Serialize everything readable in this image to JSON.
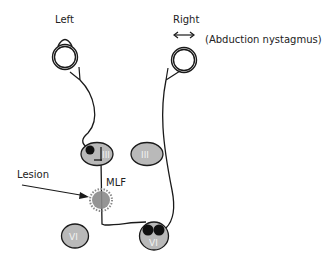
{
  "labels": {
    "left_eye": "Left",
    "right_eye": "Right",
    "right_note": "(Abduction nystagmus)",
    "lesion": "Lesion",
    "mlf": "MLF"
  },
  "nuclei": {
    "left_iii": "III",
    "right_iii": "III",
    "left_vi": "VI",
    "right_vi": "VI"
  },
  "colors": {
    "line": "#1a1a1a",
    "nucleus_fill": "#b9b9b9",
    "lesion_fill": "#8a8a8a",
    "neuron": "#111111"
  }
}
